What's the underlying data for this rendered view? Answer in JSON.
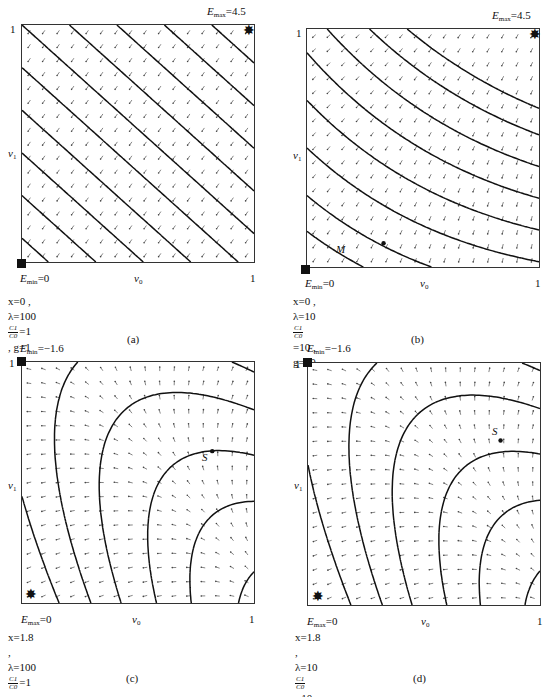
{
  "figure": {
    "panels": [
      {
        "id": "a",
        "caption": "(a)",
        "top_label": "E_max=4.5",
        "top_label_main": "E",
        "top_label_sub": "max",
        "top_label_val": "=4.5",
        "corner_label_main": "E",
        "corner_label_sub": "min",
        "corner_label_val": "=0",
        "y_tick_top": "1",
        "x_tick_right": "1",
        "y_axis_label": "v1",
        "y_axis_main": "v",
        "y_axis_sub": "1",
        "x_axis_main": "v",
        "x_axis_sub": "0",
        "param_line1": "x=0 ,  λ=100",
        "ratio_num": "C1",
        "ratio_den": "C0",
        "param_line2": "=1 ,  g=1",
        "marker_square": "bottom-left (E_min)",
        "marker_star": "top-right (E_max)"
      },
      {
        "id": "b",
        "caption": "(b)",
        "top_label_main": "E",
        "top_label_sub": "max",
        "top_label_val": "=4.5",
        "corner_label_main": "E",
        "corner_label_sub": "min",
        "corner_label_val": "=0",
        "y_tick_top": "1",
        "x_tick_right": "1",
        "y_axis_main": "v",
        "y_axis_sub": "1",
        "x_axis_main": "v",
        "x_axis_sub": "0",
        "param_line1": "x=0 ,  λ=10",
        "ratio_num": "C1",
        "ratio_den": "C0",
        "param_line2": "=10 ,  g=10",
        "point_label": "M"
      },
      {
        "id": "c",
        "caption": "(c)",
        "top_label_main": "E",
        "top_label_sub": "min",
        "top_label_val": "=−1.6",
        "corner_label_main": "E",
        "corner_label_sub": "max",
        "corner_label_val": "=0",
        "y_tick_top": "1",
        "x_tick_right": "1",
        "y_axis_main": "v",
        "y_axis_sub": "1",
        "x_axis_main": "v",
        "x_axis_sub": "0",
        "param_line1": "x=1.8 ,  λ=100",
        "ratio_num": "C1",
        "ratio_den": "C0",
        "param_line2": "=1 ,  g=0.1",
        "point_label": "S"
      },
      {
        "id": "d",
        "caption": "(d)",
        "top_label_main": "E",
        "top_label_sub": "min",
        "top_label_val": "=−1.6",
        "corner_label_main": "E",
        "corner_label_sub": "max",
        "corner_label_val": "=0",
        "y_tick_top": "1",
        "x_tick_right": "1",
        "y_axis_main": "v",
        "y_axis_sub": "1",
        "x_axis_main": "v",
        "x_axis_sub": "0",
        "param_line1": "x=1.8 ,  λ=10",
        "ratio_num": "C1",
        "ratio_den": "C0",
        "param_line2": "=10 ,  g=1",
        "point_label": "S"
      }
    ],
    "colors": {
      "line": "#111111",
      "arrow": "#555555",
      "frame": "#333333"
    }
  }
}
